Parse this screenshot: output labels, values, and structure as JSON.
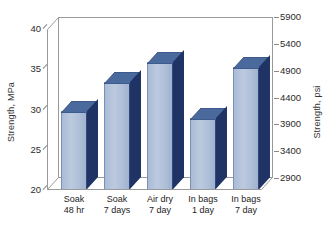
{
  "chart_data": {
    "type": "bar",
    "title": "",
    "subtitle": "",
    "categories": [
      "Soak 48 hr",
      "Soak 7 days",
      "Air dry 7 day",
      "In bags 1 day",
      "In bags 7 day"
    ],
    "category_lines": [
      [
        "Soak",
        "48 hr"
      ],
      [
        "Soak",
        "7 days"
      ],
      [
        "Air dry",
        "7 day"
      ],
      [
        "In bags",
        "1 day"
      ],
      [
        "In bags",
        "7 day"
      ]
    ],
    "values": [
      29.7,
      33.3,
      35.8,
      28.8,
      35.2
    ],
    "values_psi": [
      4308,
      4830,
      5192,
      4177,
      5105
    ],
    "xlabel": "",
    "ylabel": "Strength, MPa",
    "y2label": "Strength, psi",
    "ylim": [
      20,
      40
    ],
    "y2lim": [
      2900,
      5900
    ],
    "yticks": [
      20,
      25,
      30,
      35,
      40
    ],
    "y2ticks": [
      2900,
      3400,
      3900,
      4400,
      4900,
      5400,
      5900
    ],
    "grid": false,
    "legend": "none",
    "style": "3d-isometric-column",
    "colors": {
      "bar_front": "#aebfd8",
      "bar_top": "#4a6a9e",
      "bar_side": "#1f3464",
      "axis": "#9a9a9a",
      "text": "#2b2b2b",
      "background": "#ffffff"
    }
  },
  "axes": {
    "left": {
      "title": "Strength, MPa",
      "ticks": [
        "40",
        "35",
        "30",
        "25",
        "20"
      ]
    },
    "right": {
      "title": "Strength, psi",
      "ticks": [
        "5900",
        "5400",
        "4900",
        "4400",
        "3900",
        "3400",
        "2900"
      ]
    }
  }
}
